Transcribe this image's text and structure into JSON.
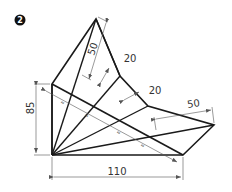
{
  "figure": {
    "badge_number": "2",
    "dimensions": {
      "height_left": "85",
      "width_bottom": "110",
      "top_slant": "50",
      "notch_upper": "20",
      "notch_lower": "20",
      "right_slant": "50"
    },
    "equal_marks": [
      "=",
      "=",
      "=",
      "="
    ],
    "colors": {
      "outline": "#1a1a1a",
      "dimension_line": "#555555",
      "badge": "#111111"
    }
  }
}
